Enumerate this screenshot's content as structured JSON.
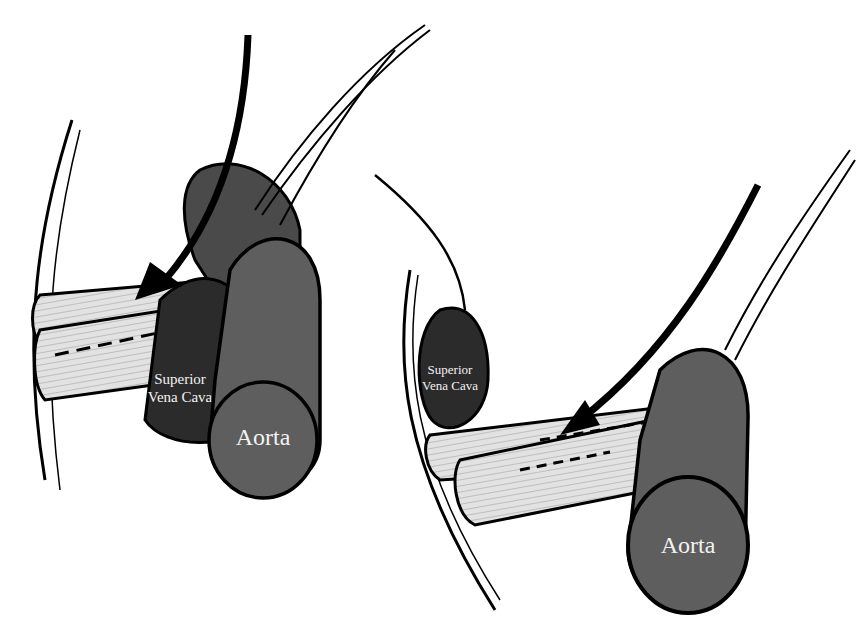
{
  "left_panel": {
    "svc_label_line1": "Superior",
    "svc_label_line2": "Vena Cava",
    "aorta_label": "Aorta"
  },
  "right_panel": {
    "svc_label_line1": "Superior",
    "svc_label_line2": "Vena Cava",
    "aorta_label": "Aorta"
  },
  "colors": {
    "svc_fill": "#2b2b2b",
    "aorta_fill": "#5e5e5e",
    "vessel_fill": "#dcdcdc",
    "outline": "#000000"
  }
}
